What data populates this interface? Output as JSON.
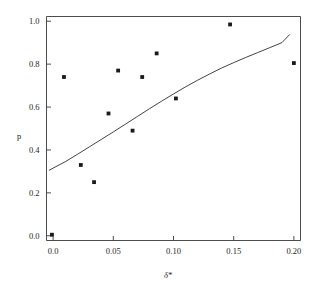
{
  "chart_data": {
    "type": "scatter",
    "title": "",
    "subtitle": "",
    "xlabel": "δ*",
    "ylabel": "p",
    "xlim": [
      -0.0055,
      0.2055
    ],
    "ylim": [
      -0.022,
      1.022
    ],
    "grid": false,
    "legend": null,
    "xticks": [
      0.0,
      0.05,
      0.1,
      0.15,
      0.2
    ],
    "xticklabels": [
      "0.0",
      "0.05",
      "0.10",
      "0.15",
      "0.20"
    ],
    "yticks": [
      0.0,
      0.2,
      0.4,
      0.6,
      0.8,
      1.0
    ],
    "yticklabels": [
      "0.0",
      "0.2",
      "0.4",
      "0.6",
      "0.8",
      "1.0"
    ],
    "series": [
      {
        "name": "observed",
        "type": "scatter",
        "marker": "square",
        "marker_size": 2.6,
        "color": "#1a1a1a",
        "x": [
          -0.001,
          0.009,
          0.023,
          0.034,
          0.046,
          0.054,
          0.066,
          0.074,
          0.086,
          0.102,
          0.147,
          0.2
        ],
        "y": [
          0.005,
          0.74,
          0.33,
          0.25,
          0.57,
          0.77,
          0.49,
          0.74,
          0.85,
          0.64,
          0.985,
          0.805
        ]
      },
      {
        "name": "fitted curve",
        "type": "line",
        "color": "#2e2e2e",
        "x": [
          -0.0035,
          0.01,
          0.02,
          0.03,
          0.04,
          0.05,
          0.06,
          0.07,
          0.08,
          0.09,
          0.1,
          0.11,
          0.12,
          0.13,
          0.14,
          0.15,
          0.16,
          0.17,
          0.18,
          0.19,
          0.1965
        ],
        "y": [
          0.305,
          0.345,
          0.379,
          0.414,
          0.449,
          0.484,
          0.52,
          0.556,
          0.592,
          0.627,
          0.661,
          0.694,
          0.725,
          0.754,
          0.782,
          0.807,
          0.831,
          0.854,
          0.877,
          0.9,
          0.938
        ]
      }
    ]
  },
  "axes": {
    "xlabel": "δ*",
    "ylabel": "p"
  },
  "colors": {
    "marker": "#1a1a1a",
    "curve": "#2e2e2e",
    "frame": "#3a3a3a",
    "background": "#ffffff",
    "text": "#262626"
  }
}
